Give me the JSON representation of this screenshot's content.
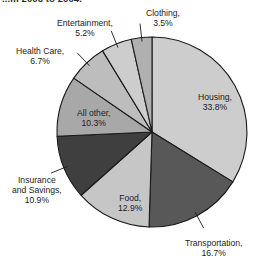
{
  "caption": {
    "fragment": "...m 2003 to 2004."
  },
  "chart_data": {
    "type": "pie",
    "title": "",
    "subtitle": "",
    "xlabel": "",
    "ylabel": "",
    "legend_position": "none",
    "grid": false,
    "units": "percent",
    "start_angle_deg": 0,
    "direction": "clockwise",
    "categories": [
      "Housing",
      "Transportation",
      "Food",
      "Insurance and Savings",
      "All other",
      "Health Care",
      "Entertainment",
      "Clothing"
    ],
    "values": [
      33.8,
      16.7,
      12.9,
      10.9,
      10.3,
      6.7,
      5.2,
      3.5
    ],
    "slices": [
      {
        "name": "Housing",
        "value": 33.8,
        "label": "Housing,",
        "value_label": "33.8%",
        "color": "#cdcdcd",
        "label_placement": "inside",
        "label_x": 198,
        "label_y": 92
      },
      {
        "name": "Transportation",
        "value": 16.7,
        "label": "Transportation,",
        "value_label": "16.7%",
        "color": "#585858",
        "label_placement": "callout",
        "label_x": 185,
        "label_y": 238
      },
      {
        "name": "Food",
        "value": 12.9,
        "label": "Food,",
        "value_label": "12.9%",
        "color": "#c6c6c6",
        "label_placement": "inside",
        "label_x": 118,
        "label_y": 193
      },
      {
        "name": "Insurance and Savings",
        "value": 10.9,
        "label": "Insurance and Savings,",
        "value_label": "10.9%",
        "color": "#3f3f3f",
        "label_placement": "callout",
        "label_x": 12,
        "label_y": 175
      },
      {
        "name": "All other",
        "value": 10.3,
        "label": "All other,",
        "value_label": "10.3%",
        "color": "#a8a8a8",
        "label_placement": "inside",
        "label_x": 77,
        "label_y": 108
      },
      {
        "name": "Health Care",
        "value": 6.7,
        "label": "Health Care,",
        "value_label": "6.7%",
        "color": "#bdbdbd",
        "label_placement": "callout",
        "label_x": 16,
        "label_y": 46
      },
      {
        "name": "Entertainment",
        "value": 5.2,
        "label": "Entertainment,",
        "value_label": "5.2%",
        "color": "#cdcdcd",
        "label_placement": "callout",
        "label_x": 57,
        "label_y": 18
      },
      {
        "name": "Clothing",
        "value": 3.5,
        "label": "Clothing,",
        "value_label": "3.5%",
        "color": "#b0b0b0",
        "label_placement": "callout",
        "label_x": 146,
        "label_y": 8
      }
    ],
    "geometry": {
      "center_x": 152,
      "center_y": 132,
      "radius": 95
    },
    "style": {
      "outline_color": "#1a1a1a",
      "background": "#ffffff",
      "leader_line_color": "#1a1a1a"
    }
  }
}
